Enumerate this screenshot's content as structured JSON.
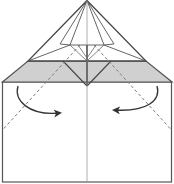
{
  "diagram": {
    "type": "origami-fold-step",
    "colors": {
      "background": "#ffffff",
      "paper_back": "#d0d0d0",
      "outline": "#444444",
      "crease": "#9a9a9a",
      "fold_line": "#7a7a7a",
      "arrow": "#333333"
    },
    "elements": {
      "apex_triangle": "upper-triangle",
      "colored_band": "gray-band",
      "body": "lower-rectangle",
      "center_crease": "vertical-center-line",
      "valley_folds": [
        "left-valley-fold",
        "right-valley-fold"
      ],
      "arrows": [
        "left-fold-arrow",
        "right-fold-arrow"
      ]
    }
  }
}
